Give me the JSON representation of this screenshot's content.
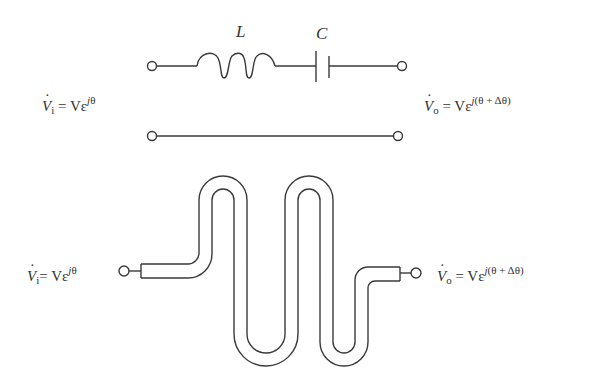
{
  "figure": {
    "lumped_circuit": {
      "inductor_label": "L",
      "capacitor_label": "C",
      "input_voltage": {
        "symbol": "V",
        "subscript": "i",
        "rhs": "= Vε",
        "exponent_j": "j",
        "exponent_rest": "θ"
      },
      "output_voltage": {
        "symbol": "V",
        "subscript": "o",
        "rhs": "= Vε",
        "exponent_j": "j",
        "exponent_rest": "(θ + Δθ)"
      }
    },
    "meander_line": {
      "input_voltage": {
        "symbol": "V",
        "subscript": "i",
        "rhs": "= Vε",
        "exponent_j": "j",
        "exponent_rest": "θ"
      },
      "output_voltage": {
        "symbol": "V",
        "subscript": "o",
        "rhs": "= Vε",
        "exponent_j": "j",
        "exponent_rest": "(θ + Δθ)"
      }
    },
    "colors": {
      "line": "#3a3a3a",
      "text": "#333333",
      "background": "#ffffff"
    }
  }
}
